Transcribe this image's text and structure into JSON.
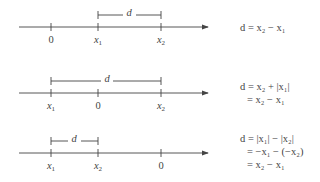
{
  "diagrams": [
    {
      "axis_y": 27,
      "ticks": [
        {
          "x": 51,
          "label": "0"
        },
        {
          "x": 98,
          "label": "x",
          "sub": "1"
        },
        {
          "x": 161,
          "label": "x",
          "sub": "2"
        }
      ],
      "bracket": {
        "x1": 98,
        "x2": 161,
        "y": 15,
        "label": "d"
      },
      "equation": {
        "lines": [
          "d = x₂ − x₁"
        ]
      }
    },
    {
      "axis_y": 93,
      "ticks": [
        {
          "x": 51,
          "label": "x",
          "sub": "1"
        },
        {
          "x": 98,
          "label": "0"
        },
        {
          "x": 161,
          "label": "x",
          "sub": "2"
        }
      ],
      "bracket": {
        "x1": 51,
        "x2": 161,
        "y": 81,
        "label": "d"
      },
      "equation": {
        "lines": [
          "d = x₂ + |x₁|",
          "= x₂ − x₁"
        ]
      }
    },
    {
      "axis_y": 153,
      "ticks": [
        {
          "x": 51,
          "label": "x",
          "sub": "1"
        },
        {
          "x": 98,
          "label": "x",
          "sub": "2"
        },
        {
          "x": 161,
          "label": "0"
        }
      ],
      "bracket": {
        "x1": 51,
        "x2": 98,
        "y": 141,
        "label": "d"
      },
      "equation": {
        "lines": [
          "d = |x₁| − |x₂|",
          "= −x₁ − (−x₂)",
          "= x₂ − x₁"
        ]
      }
    }
  ],
  "axis": {
    "x_start": 19,
    "x_end": 210,
    "color": "#444444"
  }
}
